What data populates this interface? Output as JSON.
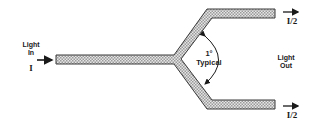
{
  "diagram": {
    "type": "y-branch-splitter",
    "input": {
      "label_line1": "Light",
      "label_line2": "In",
      "intensity": "I"
    },
    "branch_angle": {
      "value": "1°",
      "qualifier": "Typical"
    },
    "output": {
      "label_line1": "Light",
      "label_line2": "Out",
      "upper_intensity": "I/2",
      "lower_intensity": "I/2"
    },
    "colors": {
      "outline": "#3a3a3a",
      "fill_pattern": "#bdbdbd",
      "text": "#1a1a1a"
    }
  }
}
